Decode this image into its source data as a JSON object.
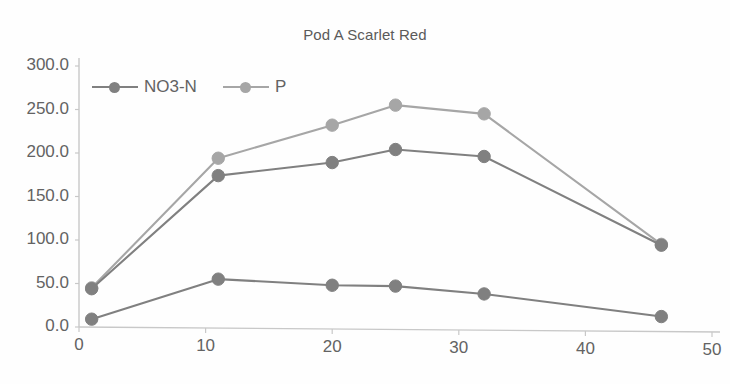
{
  "chart_data": {
    "type": "line",
    "title": "Pod A Scarlet Red",
    "xlabel": "",
    "ylabel": "",
    "xlim": [
      0,
      50
    ],
    "ylim": [
      0,
      300
    ],
    "grid": false,
    "legend_position": "top-left",
    "x_ticks": [
      "0",
      "10",
      "20",
      "30",
      "40",
      "50"
    ],
    "x_tick_values": [
      0,
      10,
      20,
      30,
      40,
      50
    ],
    "y_ticks": [
      "0.0",
      "50.0",
      "100.0",
      "150.0",
      "200.0",
      "250.0",
      "300.0"
    ],
    "y_tick_values": [
      0,
      50,
      100,
      150,
      200,
      250,
      300
    ],
    "x": [
      1,
      11,
      20,
      25,
      32,
      46
    ],
    "series": [
      {
        "name": "P",
        "color": "#a6a6a6",
        "values": [
          45,
          194,
          232,
          255,
          245,
          95
        ]
      },
      {
        "name": "NO3-N upper",
        "color": "#808080",
        "values": [
          44,
          174,
          189,
          204,
          196,
          94
        ]
      },
      {
        "name": "NO3-N",
        "color": "#808080",
        "values": [
          9,
          55,
          48,
          47,
          38,
          12
        ]
      }
    ],
    "legend": [
      {
        "label": "NO3-N",
        "color": "#808080"
      },
      {
        "label": "P",
        "color": "#a6a6a6"
      }
    ],
    "axis_color": "#c8c8c8",
    "background": "#fefefe"
  }
}
